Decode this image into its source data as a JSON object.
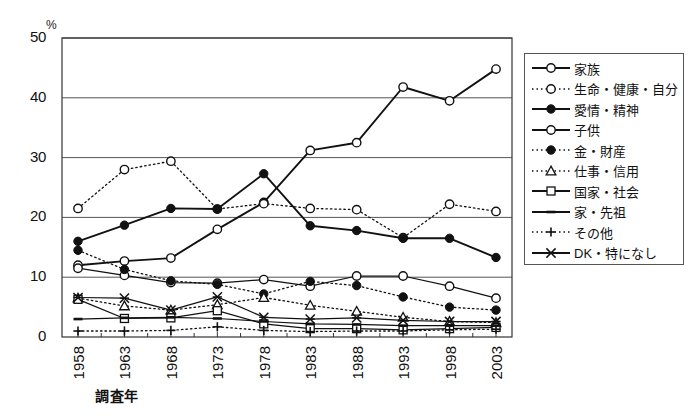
{
  "chart_data": {
    "type": "line",
    "title": "",
    "xlabel": "調査年",
    "ylabel": "",
    "unit_label": "%",
    "categories": [
      "1958",
      "1963",
      "1968",
      "1973",
      "1978",
      "1983",
      "1988",
      "1993",
      "1998",
      "2003"
    ],
    "ylim": [
      0,
      50
    ],
    "yticks": [
      0,
      10,
      20,
      30,
      40,
      50
    ],
    "grid": "horizontal",
    "legend_position": "right",
    "series": [
      {
        "name": "家族",
        "marker": "circle-open",
        "line": "solid",
        "values": [
          12.0,
          12.7,
          13.2,
          18.0,
          22.5,
          31.2,
          32.5,
          41.8,
          39.5,
          44.8
        ]
      },
      {
        "name": "生命・健康・自分",
        "marker": "circle-open",
        "line": "dotted",
        "values": [
          21.5,
          28.0,
          29.4,
          21.4,
          22.3,
          21.5,
          21.3,
          16.6,
          22.2,
          21.0
        ]
      },
      {
        "name": "愛情・精神",
        "marker": "circle-filled",
        "line": "solid",
        "values": [
          16.0,
          18.7,
          21.5,
          21.4,
          27.3,
          18.6,
          17.8,
          16.5,
          16.5,
          13.3
        ]
      },
      {
        "name": "子供",
        "marker": "circle-open",
        "line": "solid",
        "values": [
          11.5,
          10.3,
          9.1,
          9.0,
          9.6,
          8.5,
          10.2,
          10.2,
          8.5,
          6.5
        ]
      },
      {
        "name": "金・財産",
        "marker": "circle-filled",
        "line": "dotted",
        "values": [
          14.5,
          11.3,
          9.4,
          8.8,
          7.2,
          9.3,
          8.6,
          6.7,
          5.0,
          4.5
        ]
      },
      {
        "name": "仕事・信用",
        "marker": "triangle-open",
        "line": "dotted",
        "values": [
          6.5,
          5.2,
          4.5,
          5.4,
          6.6,
          5.3,
          4.3,
          3.3,
          2.6,
          2.4
        ]
      },
      {
        "name": "国家・社会",
        "marker": "square-open",
        "line": "solid",
        "values": [
          6.3,
          3.1,
          3.2,
          4.4,
          2.2,
          1.4,
          1.4,
          1.2,
          1.4,
          1.6
        ]
      },
      {
        "name": "家・先祖",
        "marker": "dash",
        "line": "solid",
        "values": [
          3.0,
          3.2,
          3.3,
          3.1,
          2.6,
          2.2,
          2.1,
          1.9,
          1.9,
          1.9
        ]
      },
      {
        "name": "その他",
        "marker": "plus",
        "line": "dotted",
        "values": [
          1.0,
          1.0,
          1.1,
          1.7,
          1.1,
          0.9,
          1.0,
          1.0,
          1.2,
          1.3
        ]
      },
      {
        "name": "DK・特になし",
        "marker": "star-x",
        "line": "solid",
        "values": [
          6.6,
          6.5,
          4.5,
          6.7,
          3.3,
          3.0,
          3.2,
          2.8,
          2.6,
          2.6
        ]
      }
    ]
  },
  "axes": {
    "y_tick_labels": [
      "50",
      "40",
      "30",
      "20",
      "10",
      "0"
    ],
    "x_tick_labels": [
      "1958",
      "1963",
      "1968",
      "1973",
      "1978",
      "1983",
      "1988",
      "1993",
      "1998",
      "2003"
    ],
    "percent_symbol": "%",
    "x_axis_title": "調査年"
  },
  "legend": {
    "items": [
      {
        "label": "家族",
        "marker": "circle-open",
        "line": "solid"
      },
      {
        "label": "生命・健康・自分",
        "marker": "circle-open",
        "line": "dotted"
      },
      {
        "label": "愛情・精神",
        "marker": "circle-filled",
        "line": "solid"
      },
      {
        "label": "子供",
        "marker": "circle-open",
        "line": "solid"
      },
      {
        "label": "金・財産",
        "marker": "circle-filled",
        "line": "dotted"
      },
      {
        "label": "仕事・信用",
        "marker": "triangle-open",
        "line": "dotted"
      },
      {
        "label": "国家・社会",
        "marker": "square-open",
        "line": "solid"
      },
      {
        "label": "家・先祖",
        "marker": "dash",
        "line": "solid"
      },
      {
        "label": "その他",
        "marker": "plus",
        "line": "dotted"
      },
      {
        "label": "DK・特になし",
        "marker": "star-x",
        "line": "solid"
      }
    ]
  },
  "colors": {
    "line": "#111111",
    "grid": "#555555",
    "border": "#333333",
    "background": "#ffffff",
    "marker_fill_open": "#ffffff",
    "marker_fill_solid": "#111111"
  }
}
